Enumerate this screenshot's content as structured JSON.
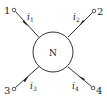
{
  "diagram": {
    "type": "four-terminal network",
    "center_label": "N",
    "terminals": [
      {
        "id": "1",
        "label": "1",
        "current": "i",
        "current_sub": "1",
        "direction": "into N"
      },
      {
        "id": "2",
        "label": "2",
        "current": "i",
        "current_sub": "2",
        "direction": "into N"
      },
      {
        "id": "3",
        "label": "3",
        "current": "i",
        "current_sub": "3",
        "direction": "into N"
      },
      {
        "id": "4",
        "label": "4",
        "current": "i",
        "current_sub": "4",
        "direction": "into N"
      }
    ],
    "colors": {
      "stroke": "#333333",
      "background": "#ffffff"
    }
  }
}
